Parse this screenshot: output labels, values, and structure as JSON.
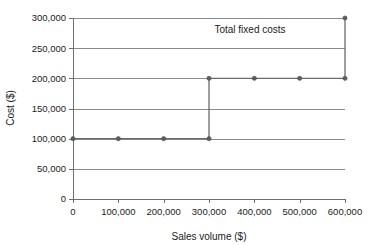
{
  "chart_data": {
    "type": "line",
    "subtype": "step",
    "title": "",
    "annotation": "Total fixed costs",
    "xlabel": "Sales volume ($)",
    "ylabel": "Cost ($)",
    "xlim": [
      0,
      600000
    ],
    "ylim": [
      0,
      300000
    ],
    "grid": true,
    "grid_axis": "y",
    "legend": false,
    "x_ticks": [
      0,
      100000,
      200000,
      300000,
      400000,
      500000,
      600000
    ],
    "x_tick_labels": [
      "0",
      "100,000",
      "200,000",
      "300,000",
      "400,000",
      "500,000",
      "600,000"
    ],
    "y_ticks": [
      0,
      50000,
      100000,
      150000,
      200000,
      250000,
      300000
    ],
    "y_tick_labels": [
      "0",
      "50,000",
      "100,000",
      "150,000",
      "200,000",
      "250,000",
      "300,000"
    ],
    "series": [
      {
        "name": "Total fixed costs",
        "color": "#6b6b6b",
        "marker": "circle",
        "x": [
          0,
          100000,
          200000,
          300000,
          300000,
          400000,
          500000,
          600000,
          600000
        ],
        "values": [
          100000,
          100000,
          100000,
          100000,
          200000,
          200000,
          200000,
          200000,
          300000
        ],
        "marker_points": [
          {
            "x": 0,
            "y": 100000
          },
          {
            "x": 100000,
            "y": 100000
          },
          {
            "x": 200000,
            "y": 100000
          },
          {
            "x": 300000,
            "y": 100000
          },
          {
            "x": 300000,
            "y": 200000
          },
          {
            "x": 400000,
            "y": 200000
          },
          {
            "x": 500000,
            "y": 200000
          },
          {
            "x": 600000,
            "y": 200000
          },
          {
            "x": 600000,
            "y": 300000
          }
        ]
      }
    ]
  },
  "colors": {
    "background": "#ffffff",
    "gridline": "#8a8a8a",
    "axis": "#6e6e6e",
    "series": "#6b6b6b",
    "text": "#1a1a1a"
  }
}
